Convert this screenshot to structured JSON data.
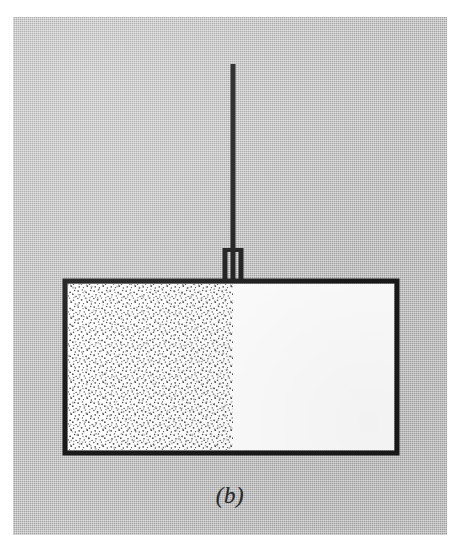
{
  "figure": {
    "label": "(b)",
    "caption_style": "italic",
    "page_background": "#ffffff",
    "panel_background": "#b9b9b9",
    "ink_color": "#1a1a1a"
  },
  "diagram": {
    "type": "physics-thermodynamics-schematic",
    "container": {
      "name": "cylinder",
      "x": 52,
      "y": 264,
      "width": 332,
      "height": 172,
      "stroke_width": 5,
      "stroke_color": "#1a1a1a",
      "fill_color": "#ffffff"
    },
    "gas_region": {
      "name": "stippled-gas",
      "x": 55,
      "y": 267,
      "width": 165,
      "height": 166,
      "fill_description": "random fine stipple dots",
      "dot_color": "#555555",
      "fraction_of_cylinder": 0.5
    },
    "piston": {
      "name": "piston-face",
      "x": 220,
      "y": 267,
      "height": 166,
      "description": "boundary between stippled gas and empty volume"
    },
    "rod": {
      "name": "piston-rod",
      "x_center": 220,
      "y_top": 47,
      "y_bottom": 264,
      "thickness": 5,
      "color": "#1a1a1a"
    },
    "collar": {
      "name": "rod-collar",
      "x_center": 220,
      "y_top": 230,
      "y_bottom": 264,
      "width": 17,
      "description": "two short vertical bars flanking the rod where it passes through the cylinder lid"
    }
  },
  "annotations": {
    "alt_text": "Schematic (b): a rectangular gas cylinder, its left half filled with stippled gas, a vertical piston rod entering through a collar in the top wall."
  }
}
